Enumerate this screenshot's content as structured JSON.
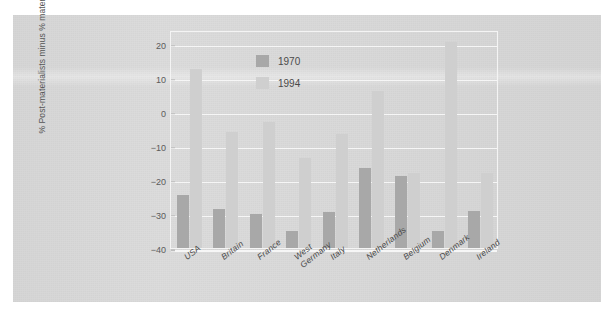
{
  "figure": {
    "background_color": "#ffffff",
    "page_color": "#d9d9d9",
    "frame_color": "#f4f4f4",
    "gridline_color": "#f6f6f6"
  },
  "chart_data": {
    "type": "bar",
    "title": "",
    "subtitle": "",
    "xlabel": "",
    "ylabel": "% Post-materialists minus % materialists",
    "ylim": [
      -40,
      24
    ],
    "yticks": [
      20,
      10,
      0,
      -10,
      -20,
      -30,
      -40
    ],
    "ytick_labels": [
      "20",
      "10",
      "0",
      "−10",
      "−20",
      "−30",
      "−40"
    ],
    "grid": true,
    "legend_position": "upper center",
    "categories": [
      "USA",
      "Britain",
      "France",
      "West\nGermany",
      "Italy",
      "Netherlands",
      "Belgium",
      "Denmark",
      "Ireland"
    ],
    "category_labels": [
      [
        "USA"
      ],
      [
        "Britain"
      ],
      [
        "France"
      ],
      [
        "West",
        "Germany"
      ],
      [
        "Italy"
      ],
      [
        "Netherlands"
      ],
      [
        "Belgium"
      ],
      [
        "Denmark"
      ],
      [
        "Ireland"
      ]
    ],
    "series": [
      {
        "name": "1970",
        "color": "#a8a8a8",
        "values": [
          -24.5,
          -28.5,
          -30,
          -35,
          -29.5,
          -16.5,
          -19,
          -35,
          -29
        ]
      },
      {
        "name": "1994",
        "color": "#cfcfcf",
        "values": [
          12.5,
          -6,
          -3,
          -13.5,
          -6.5,
          6,
          -18,
          20.5,
          -18
        ]
      }
    ]
  },
  "legend": {
    "entries": [
      {
        "label": "1970",
        "color": "#a8a8a8"
      },
      {
        "label": "1994",
        "color": "#cfcfcf"
      }
    ]
  }
}
